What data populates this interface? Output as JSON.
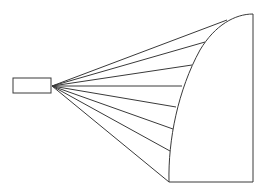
{
  "diagram": {
    "stroke_color": "#3a3a3a",
    "background": "#ffffff",
    "source_box": {
      "x": 13,
      "y": 78,
      "width": 38,
      "height": 15
    },
    "origin": {
      "x": 52,
      "y": 86
    },
    "rays": [
      {
        "x2": 227,
        "y2": 20
      },
      {
        "x2": 205,
        "y2": 42
      },
      {
        "x2": 192,
        "y2": 65
      },
      {
        "x2": 182,
        "y2": 86
      },
      {
        "x2": 176,
        "y2": 107
      },
      {
        "x2": 173,
        "y2": 129
      },
      {
        "x2": 170,
        "y2": 151
      },
      {
        "x2": 169,
        "y2": 182
      }
    ],
    "curved_surface_path": "M 169 182 C 168 140, 178 90, 200 50 C 215 25, 235 14, 253 14",
    "right_edge": {
      "x1": 253,
      "y1": 14,
      "x2": 253,
      "y2": 182
    },
    "bottom_edge": {
      "x1": 169,
      "y1": 182,
      "x2": 253,
      "y2": 182
    }
  }
}
